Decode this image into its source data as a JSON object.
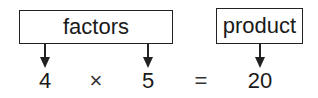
{
  "diagram": {
    "factors_label": "factors",
    "product_label": "product",
    "equation": {
      "factor1": "4",
      "operator": "×",
      "factor2": "5",
      "equals": "=",
      "product": "20"
    }
  }
}
